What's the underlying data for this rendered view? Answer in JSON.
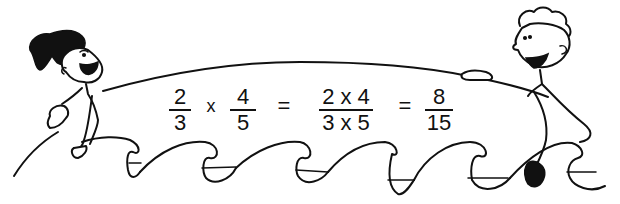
{
  "illustration": {
    "description": "Two cartoon children riding ocean waves, holding a banner with a fraction multiplication",
    "characters": [
      "girl-surfer",
      "boy-surfer"
    ],
    "ink_color": "#111111",
    "background_color": "#ffffff"
  },
  "equation": {
    "fraction_1": {
      "numerator": "2",
      "denominator": "3"
    },
    "operator_multiply": "x",
    "fraction_2": {
      "numerator": "4",
      "denominator": "5"
    },
    "equals_1": "=",
    "fraction_3": {
      "numerator": "2 x 4",
      "denominator": "3 x 5"
    },
    "equals_2": "=",
    "result": {
      "numerator": "8",
      "denominator": "15"
    }
  }
}
